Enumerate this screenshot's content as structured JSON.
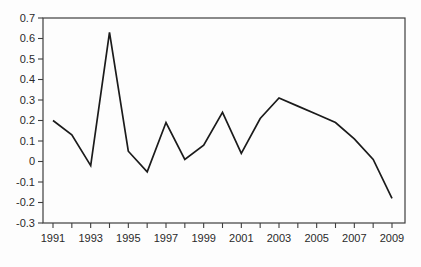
{
  "chart_data": {
    "type": "line",
    "title": "",
    "xlabel": "",
    "ylabel": "",
    "x": [
      1991,
      1992,
      1993,
      1994,
      1995,
      1996,
      1997,
      1998,
      1999,
      2000,
      2001,
      2002,
      2003,
      2004,
      2005,
      2006,
      2007,
      2008,
      2009
    ],
    "series": [
      {
        "name": "series-1",
        "values": [
          0.2,
          0.13,
          -0.02,
          0.63,
          0.05,
          -0.05,
          0.19,
          0.01,
          0.08,
          0.24,
          0.04,
          0.21,
          0.31,
          0.27,
          0.23,
          0.19,
          0.11,
          0.01,
          -0.18
        ]
      }
    ],
    "ylim": [
      -0.3,
      0.7
    ],
    "y_ticks": [
      0.7,
      0.6,
      0.5,
      0.4,
      0.3,
      0.2,
      0.1,
      0,
      -0.1,
      -0.2,
      -0.3
    ],
    "y_tick_labels": [
      "0.7",
      "0.6",
      "0.5",
      "0.4",
      "0.3",
      "0.2",
      "0.1",
      "0",
      "-0.1",
      "-0.2",
      "-0.3"
    ],
    "x_minor_tick_years": [
      1991,
      1992,
      1993,
      1994,
      1995,
      1996,
      1997,
      1998,
      1999,
      2000,
      2001,
      2002,
      2003,
      2004,
      2005,
      2006,
      2007,
      2008,
      2009
    ],
    "x_label_years": [
      "1991",
      "1993",
      "1995",
      "1997",
      "1999",
      "2001",
      "2003",
      "2005",
      "2007",
      "2009"
    ],
    "grid": false,
    "legend": "none",
    "frame": "full-box",
    "colors": {
      "line": "#1b1b1b",
      "axis": "#3f3f3f",
      "tick_label": "#2a2a2a",
      "background": "#fdfdfd"
    }
  }
}
